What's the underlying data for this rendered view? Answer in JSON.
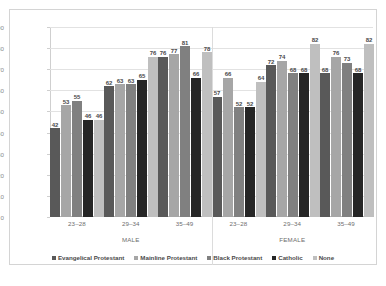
{
  "chart_data": {
    "type": "bar",
    "title": "",
    "xlabel": "",
    "ylabel": "",
    "ylim": [
      0,
      90
    ],
    "ytick_step": 10,
    "yticks": [
      "90",
      "80",
      "70",
      "60",
      "50",
      "40",
      "30",
      "20",
      "10",
      "0"
    ],
    "grid": true,
    "legend_position": "bottom",
    "categories": [
      "23–28",
      "29–34",
      "35–49",
      "23–28",
      "29–34",
      "35–49"
    ],
    "group_labels": [
      "MALE",
      "FEMALE"
    ],
    "series": [
      {
        "name": "Evangelical Protestant",
        "color": "#595959",
        "values": [
          42,
          62,
          76,
          57,
          72,
          68
        ]
      },
      {
        "name": "Mainline Protestant",
        "color": "#a6a6a6",
        "values": [
          53,
          63,
          77,
          66,
          74,
          76
        ]
      },
      {
        "name": "Black Protestant",
        "color": "#808080",
        "values": [
          55,
          63,
          81,
          52,
          68,
          73
        ]
      },
      {
        "name": "Catholic",
        "color": "#262626",
        "values": [
          46,
          65,
          66,
          52,
          68,
          68
        ]
      },
      {
        "name": "None",
        "color": "#bfbfbf",
        "values": [
          46,
          76,
          78,
          64,
          82,
          82
        ]
      }
    ]
  },
  "axis": {
    "yticks": [
      "90",
      "80",
      "70",
      "60",
      "50",
      "40",
      "30",
      "20",
      "10",
      "0"
    ],
    "categories": [
      "23–28",
      "29–34",
      "35–49",
      "23–28",
      "29–34",
      "35–49"
    ],
    "sex_labels": [
      "MALE",
      "FEMALE"
    ]
  },
  "legend": {
    "items": [
      {
        "label": "Evangelical Protestant",
        "color": "#595959"
      },
      {
        "label": "Mainline Protestant",
        "color": "#a6a6a6"
      },
      {
        "label": "Black Protestant",
        "color": "#808080"
      },
      {
        "label": "Catholic",
        "color": "#262626"
      },
      {
        "label": "None",
        "color": "#bfbfbf"
      }
    ]
  }
}
